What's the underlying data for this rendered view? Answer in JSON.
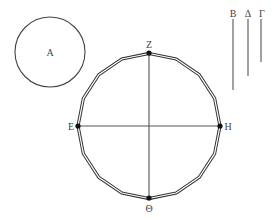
{
  "diagram": {
    "circle_A": {
      "label": "A",
      "cx": 50,
      "cy": 52,
      "r": 35
    },
    "segments": [
      {
        "label": "B",
        "x": 233,
        "y1": 19,
        "y2": 90
      },
      {
        "label": "Δ",
        "x": 248,
        "y1": 19,
        "y2": 76
      },
      {
        "label": "Γ",
        "x": 261,
        "y1": 19,
        "y2": 62
      }
    ],
    "main_figure": {
      "center": [
        149,
        126
      ],
      "radius": 72,
      "polygon_sides": 16,
      "points": {
        "top": "Z",
        "left": "E",
        "right": "H",
        "bottom": "Θ"
      }
    }
  }
}
